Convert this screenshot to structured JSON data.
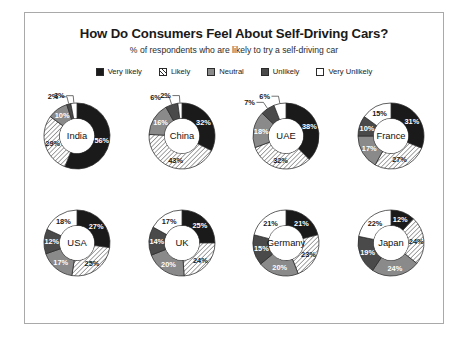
{
  "header": {
    "title": "How Do Consumers Feel About Self-Driving Cars?",
    "subtitle": "% of respondents who are likely to try a self-driving car"
  },
  "legend": {
    "items": [
      {
        "label": "Very likely",
        "fill": "#1a1a1a",
        "style": "solid"
      },
      {
        "label": "Likely",
        "fill": "#ffffff",
        "style": "hatch"
      },
      {
        "label": "Neutral",
        "fill": "#8a8a8a",
        "style": "solid"
      },
      {
        "label": "Unlikely",
        "fill": "#4a4a4a",
        "style": "solid"
      },
      {
        "label": "Very Unlikely",
        "fill": "#ffffff",
        "style": "solid"
      }
    ]
  },
  "chart_data": {
    "type": "pie",
    "title": "How Do Consumers Feel About Self-Driving Cars?",
    "subtitle": "% of respondents who are likely to try a self-driving car",
    "unit": "%",
    "legend_position": "top",
    "grid": false,
    "categories": [
      "Very likely",
      "Likely",
      "Neutral",
      "Unlikely",
      "Very Unlikely"
    ],
    "colors": [
      "#1a1a1a",
      "#ffffff",
      "#8a8a8a",
      "#4a4a4a",
      "#ffffff"
    ],
    "charts": [
      {
        "name": "India",
        "values": [
          56,
          29,
          10,
          2,
          3
        ],
        "labels": [
          "56%",
          "29%",
          "10%",
          "2%",
          "3%"
        ]
      },
      {
        "name": "China",
        "values": [
          32,
          43,
          16,
          6,
          2
        ],
        "labels": [
          "32%",
          "43%",
          "16%",
          "6%",
          "2%"
        ]
      },
      {
        "name": "UAE",
        "values": [
          38,
          32,
          18,
          7,
          6
        ],
        "labels": [
          "38%",
          "32%",
          "18%",
          "7%",
          "6%"
        ]
      },
      {
        "name": "France",
        "values": [
          31,
          27,
          17,
          10,
          15
        ],
        "labels": [
          "31%",
          "27%",
          "17%",
          "10%",
          "15%"
        ]
      },
      {
        "name": "USA",
        "values": [
          27,
          25,
          17,
          12,
          18
        ],
        "labels": [
          "27%",
          "25%",
          "17%",
          "12%",
          "18%"
        ]
      },
      {
        "name": "UK",
        "values": [
          25,
          24,
          20,
          14,
          17
        ],
        "labels": [
          "25%",
          "24%",
          "20%",
          "14%",
          "17%"
        ]
      },
      {
        "name": "Germany",
        "values": [
          21,
          23,
          20,
          15,
          21
        ],
        "labels": [
          "21%",
          "23%",
          "20%",
          "15%",
          "21%"
        ]
      },
      {
        "name": "Japan",
        "values": [
          12,
          24,
          24,
          19,
          22
        ],
        "labels": [
          "12%",
          "24%",
          "24%",
          "19%",
          "22%"
        ]
      }
    ]
  }
}
